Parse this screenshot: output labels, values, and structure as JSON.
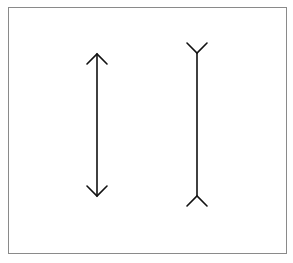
{
  "figure": {
    "name": "Müller-Lyer illusion",
    "colors": {
      "background": "#ffffff",
      "frame": "#8a8a8a",
      "stroke": "#111111"
    },
    "figures": [
      {
        "id": "arrow-outward",
        "fin_direction": "outward"
      },
      {
        "id": "arrow-inward",
        "fin_direction": "inward"
      }
    ]
  }
}
